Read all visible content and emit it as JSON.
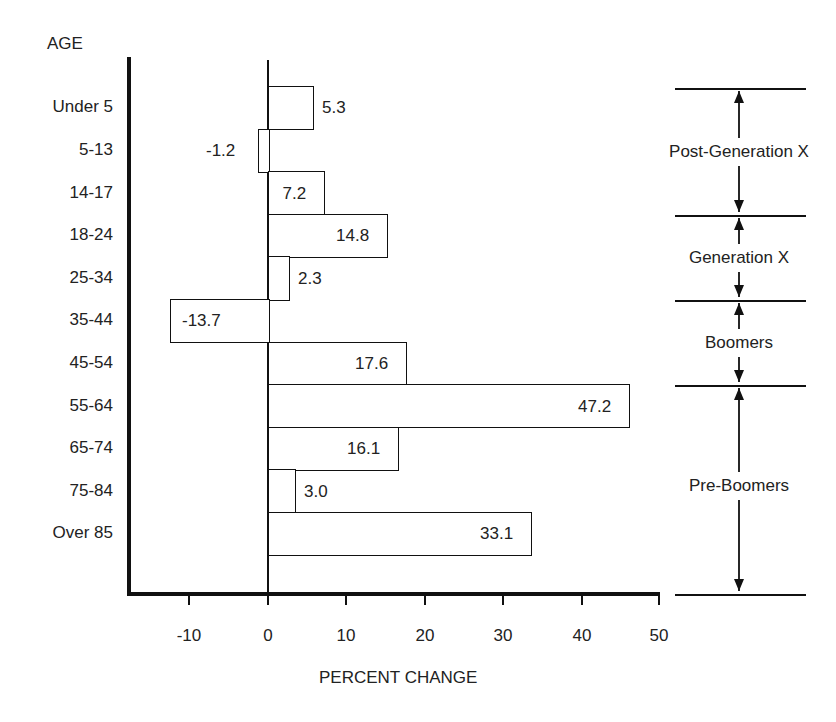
{
  "chart_data": {
    "type": "bar",
    "orientation": "horizontal",
    "title": "",
    "ylabel": "AGE",
    "xlabel": "PERCENT CHANGE",
    "categories": [
      "Under 5",
      "5-13",
      "14-17",
      "18-24",
      "25-34",
      "35-44",
      "45-54",
      "55-64",
      "65-74",
      "75-84",
      "Over 85"
    ],
    "values": [
      5.3,
      -1.2,
      7.2,
      14.8,
      2.3,
      -13.7,
      17.6,
      47.2,
      16.1,
      3.0,
      33.1
    ],
    "value_labels": [
      "5.3",
      "-1.2",
      "7.2",
      "14.8",
      "2.3",
      "-13.7",
      "17.6",
      "47.2",
      "16.1",
      "3.0",
      "33.1"
    ],
    "xlim": [
      -16,
      50
    ],
    "xticks": [
      -10,
      0,
      10,
      20,
      30,
      40,
      50
    ],
    "xtick_labels": [
      "-10",
      "0",
      "10",
      "20",
      "30",
      "40",
      "50"
    ],
    "grid": false,
    "legend": null,
    "annotations": {
      "generation_groups": [
        {
          "label": "Post-Generation X",
          "categories": [
            "Under 5",
            "5-13",
            "14-17"
          ]
        },
        {
          "label": "Generation X",
          "categories": [
            "18-24",
            "25-34"
          ]
        },
        {
          "label": "Boomers",
          "categories": [
            "35-44",
            "45-54"
          ]
        },
        {
          "label": "Pre-Boomers",
          "categories": [
            "55-64",
            "65-74",
            "75-84",
            "Over 85"
          ]
        }
      ]
    }
  },
  "labels": {
    "y_axis_title": "AGE",
    "x_axis_title": "PERCENT CHANGE"
  },
  "colors": {
    "ink": "#111111",
    "background": "#ffffff"
  }
}
